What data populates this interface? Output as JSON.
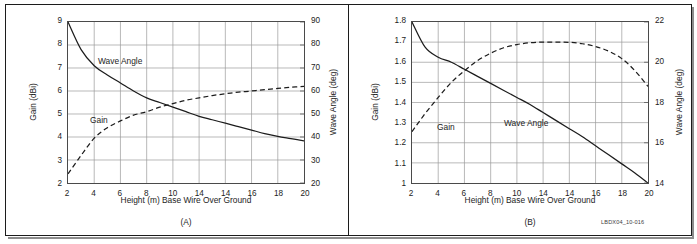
{
  "figure": {
    "code": "LBDX04_10-016"
  },
  "panels": [
    {
      "caption": "(A)",
      "xlabel": "Height (m) Base Wire Over Ground",
      "ylabel_left": "Gain (dBi)",
      "ylabel_right": "Wave Angle (deg)",
      "xticks": [
        "2",
        "4",
        "6",
        "8",
        "10",
        "14",
        "14",
        "16",
        "18",
        "20"
      ],
      "yticks_left": [
        "2",
        "3",
        "4",
        "5",
        "6",
        "7",
        "8",
        "9"
      ],
      "yticks_right": [
        "20",
        "30",
        "40",
        "50",
        "60",
        "70",
        "80",
        "90"
      ],
      "label_gain": "Gain",
      "label_wave": "Wave Angle"
    },
    {
      "caption": "(B)",
      "xlabel": "Height (m) Base Wire Over Ground",
      "ylabel_left": "Gain (dBi)",
      "ylabel_right": "Wave Angle (deg)",
      "xticks": [
        "2",
        "4",
        "6",
        "8",
        "10",
        "14",
        "14",
        "16",
        "18",
        "20"
      ],
      "yticks_left": [
        "1",
        "1.1",
        "1.2",
        "1.3",
        "1.4",
        "1.5",
        "1.6",
        "1.7",
        "1.8"
      ],
      "yticks_right": [
        "14",
        "16",
        "18",
        "20",
        "22"
      ],
      "label_gain": "Gain",
      "label_wave": "Wave Angle"
    }
  ],
  "chart_data": [
    {
      "type": "line",
      "title": "(A)",
      "xlabel": "Height (m) Base Wire Over Ground",
      "ylabel": "Gain (dBi)",
      "ylabel_right": "Wave Angle (deg)",
      "xlim": [
        2,
        20
      ],
      "ylim": [
        2,
        9
      ],
      "ylim_right": [
        20,
        90
      ],
      "grid": true,
      "x": [
        2,
        3,
        4,
        5,
        6,
        7,
        8,
        9,
        10,
        11,
        12,
        13,
        14,
        15,
        16,
        17,
        18,
        19,
        20
      ],
      "series": [
        {
          "name": "Gain",
          "axis": "left",
          "style": "dashed",
          "units": "dBi",
          "values": [
            2.4,
            3.2,
            3.95,
            4.4,
            4.7,
            4.95,
            5.1,
            5.3,
            5.45,
            5.6,
            5.7,
            5.8,
            5.88,
            5.95,
            6.0,
            6.06,
            6.11,
            6.16,
            6.2
          ]
        },
        {
          "name": "Wave Angle",
          "axis": "right",
          "style": "solid",
          "units": "deg",
          "values": [
            90,
            78,
            71,
            67,
            63.5,
            60,
            57,
            55,
            53,
            51,
            49,
            47.5,
            46,
            44.5,
            43,
            41.5,
            40.3,
            39.3,
            38.3
          ]
        }
      ]
    },
    {
      "type": "line",
      "title": "(B)",
      "xlabel": "Height (m) Base Wire Over Ground",
      "ylabel": "Gain (dBi)",
      "ylabel_right": "Wave Angle (deg)",
      "xlim": [
        2,
        20
      ],
      "ylim": [
        1,
        1.8
      ],
      "ylim_right": [
        14,
        22
      ],
      "grid": true,
      "x": [
        2,
        3,
        4,
        5,
        6,
        7,
        8,
        9,
        10,
        11,
        12,
        13,
        14,
        15,
        16,
        17,
        18,
        19,
        20
      ],
      "series": [
        {
          "name": "Gain",
          "axis": "left",
          "style": "dashed",
          "units": "dBi",
          "values": [
            1.255,
            1.345,
            1.425,
            1.5,
            1.558,
            1.608,
            1.645,
            1.672,
            1.688,
            1.697,
            1.7,
            1.7,
            1.699,
            1.692,
            1.678,
            1.655,
            1.618,
            1.558,
            1.48
          ]
        },
        {
          "name": "Wave Angle",
          "axis": "right",
          "style": "solid",
          "units": "deg",
          "values": [
            22,
            20.75,
            20.25,
            20.0,
            19.65,
            19.3,
            18.95,
            18.6,
            18.25,
            17.9,
            17.5,
            17.1,
            16.7,
            16.3,
            15.85,
            15.4,
            14.95,
            14.5,
            14.0
          ]
        }
      ]
    }
  ]
}
